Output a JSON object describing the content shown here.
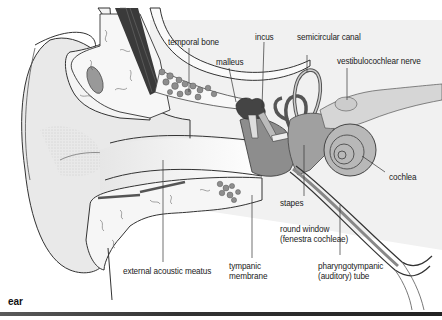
{
  "figure": {
    "caption": "ear",
    "labels": {
      "temporal_bone": "temporal bone",
      "malleus": "malleus",
      "incus": "incus",
      "semicircular_canal": "semicircular canal",
      "vestibulocochlear_nerve": "vestibulocochlear nerve",
      "cochlea": "cochlea",
      "stapes": "stapes",
      "round_window_1": "round window",
      "round_window_2": "(fenestra cochleae)",
      "pharyngotympanic_1": "pharyngotympanic",
      "pharyngotympanic_2": "(auditory) tube",
      "tympanic_1": "tympanic",
      "tympanic_2": "membrane",
      "external_acoustic_meatus": "external acoustic meatus"
    }
  }
}
